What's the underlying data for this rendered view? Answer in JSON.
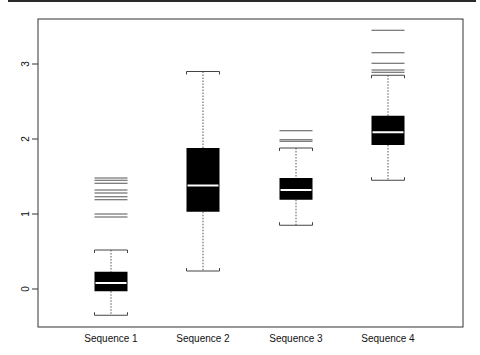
{
  "chart_data": {
    "type": "boxplot",
    "title": "",
    "xlabel": "",
    "ylabel": "",
    "ylim": [
      -0.5,
      3.6
    ],
    "yticks": [
      0,
      1,
      2,
      3
    ],
    "ytick_labels": [
      "0",
      "1",
      "2",
      "3"
    ],
    "grid": false,
    "legend": null,
    "categories": [
      "Sequence 1",
      "Sequence 2",
      "Sequence 3",
      "Sequence 4"
    ],
    "series": [
      {
        "name": "Sequence 1",
        "whisker_low": -0.35,
        "q1": -0.03,
        "median": 0.08,
        "q3": 0.23,
        "whisker_high": 0.52,
        "outliers": [
          0.96,
          1.0,
          1.19,
          1.23,
          1.28,
          1.32,
          1.41,
          1.45,
          1.48
        ]
      },
      {
        "name": "Sequence 2",
        "whisker_low": 0.24,
        "q1": 1.03,
        "median": 1.38,
        "q3": 1.88,
        "whisker_high": 2.9,
        "outliers": []
      },
      {
        "name": "Sequence 3",
        "whisker_low": 0.85,
        "q1": 1.19,
        "median": 1.32,
        "q3": 1.48,
        "whisker_high": 1.88,
        "outliers": [
          1.97,
          1.99,
          2.11
        ]
      },
      {
        "name": "Sequence 4",
        "whisker_low": 1.45,
        "q1": 1.92,
        "median": 2.09,
        "q3": 2.31,
        "whisker_high": 2.85,
        "outliers": [
          2.89,
          2.92,
          3.01,
          3.15,
          3.45
        ]
      }
    ],
    "colors": {
      "box_fill": "#000000",
      "median": "#ffffff",
      "whisker": "#555555",
      "frame": "#333333"
    }
  }
}
